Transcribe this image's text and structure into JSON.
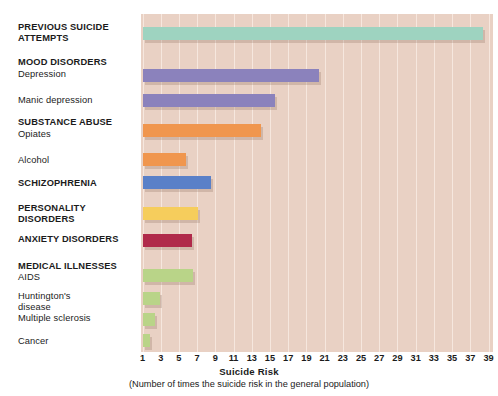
{
  "chart_data": {
    "type": "bar",
    "orientation": "horizontal",
    "title": "",
    "xlabel": "Suicide Risk",
    "caption": "(Number of times the suicide risk in the general population)",
    "ylabel": "",
    "xlim": [
      1,
      39
    ],
    "xticks": [
      1,
      3,
      5,
      7,
      9,
      11,
      13,
      15,
      17,
      19,
      21,
      23,
      25,
      27,
      29,
      31,
      33,
      35,
      37,
      39
    ],
    "grid": true,
    "legend": "none",
    "plot_background": "#e9d1c4",
    "gridline_color": "#f6e7de",
    "categories": [
      "PREVIOUS SUICIDE ATTEMPTS",
      "Depression",
      "Manic depression",
      "Opiates",
      "Alcohol",
      "SCHIZOPHRENIA",
      "PERSONALITY DISORDERS",
      "ANXIETY DISORDERS",
      "AIDS",
      "Huntington's disease",
      "Multiple sclerosis",
      "Cancer"
    ],
    "values": [
      38.4,
      20.4,
      15.5,
      14.0,
      5.8,
      8.5,
      7.1,
      6.4,
      6.6,
      2.9,
      2.4,
      1.8
    ],
    "bars": [
      {
        "label": "PREVIOUS SUICIDE ATTEMPTS",
        "value": 38.4,
        "color": "#9ed3c0"
      },
      {
        "label": "Depression",
        "value": 20.4,
        "color": "#8b82bc"
      },
      {
        "label": "Manic depression",
        "value": 15.5,
        "color": "#8b82bc"
      },
      {
        "label": "Opiates",
        "value": 14.0,
        "color": "#f0964e"
      },
      {
        "label": "Alcohol",
        "value": 5.8,
        "color": "#f0964e"
      },
      {
        "label": "SCHIZOPHRENIA",
        "value": 8.5,
        "color": "#5a80c8"
      },
      {
        "label": "PERSONALITY DISORDERS",
        "value": 7.1,
        "color": "#f6cd5c"
      },
      {
        "label": "ANXIETY DISORDERS",
        "value": 6.4,
        "color": "#b02a4a"
      },
      {
        "label": "AIDS",
        "value": 6.6,
        "color": "#b9d488"
      },
      {
        "label": "Huntington's disease",
        "value": 2.9,
        "color": "#b9d488"
      },
      {
        "label": "Multiple sclerosis",
        "value": 2.4,
        "color": "#b9d488"
      },
      {
        "label": "Cancer",
        "value": 1.8,
        "color": "#b9d488"
      }
    ]
  },
  "labels": [
    {
      "text": "PREVIOUS SUICIDE\nATTEMPTS",
      "style": "group",
      "top": 22
    },
    {
      "text": "MOOD DISORDERS",
      "style": "group",
      "top": 57
    },
    {
      "text": "Depression",
      "style": "sub",
      "top": 69
    },
    {
      "text": "Manic depression",
      "style": "sub",
      "top": 95
    },
    {
      "text": "SUBSTANCE ABUSE",
      "style": "group",
      "top": 117
    },
    {
      "text": "Opiates",
      "style": "sub",
      "top": 129
    },
    {
      "text": "Alcohol",
      "style": "sub",
      "top": 155
    },
    {
      "text": "SCHIZOPHRENIA",
      "style": "group",
      "top": 178
    },
    {
      "text": "PERSONALITY\nDISORDERS",
      "style": "group",
      "top": 203
    },
    {
      "text": "ANXIETY DISORDERS",
      "style": "group",
      "top": 234
    },
    {
      "text": "MEDICAL ILLNESSES",
      "style": "group",
      "top": 261
    },
    {
      "text": "AIDS",
      "style": "sub",
      "top": 272
    },
    {
      "text": "Huntington's\ndisease",
      "style": "sub",
      "top": 291
    },
    {
      "text": "Multiple sclerosis",
      "style": "sub",
      "top": 313
    },
    {
      "text": "Cancer",
      "style": "sub",
      "top": 336
    }
  ],
  "bar_rows": [
    {
      "name": "previous-suicide-attempts",
      "value": 38.4,
      "color": "#9ed3c0",
      "top": 27
    },
    {
      "name": "depression",
      "value": 20.4,
      "color": "#8b82bc",
      "top": 69
    },
    {
      "name": "manic-depression",
      "value": 15.5,
      "color": "#8b82bc",
      "top": 94
    },
    {
      "name": "opiates",
      "value": 14.0,
      "color": "#f0964e",
      "top": 124
    },
    {
      "name": "alcohol",
      "value": 5.8,
      "color": "#f0964e",
      "top": 153
    },
    {
      "name": "schizophrenia",
      "value": 8.5,
      "color": "#5a80c8",
      "top": 176
    },
    {
      "name": "personality-disorders",
      "value": 7.1,
      "color": "#f6cd5c",
      "top": 207
    },
    {
      "name": "anxiety-disorders",
      "value": 6.4,
      "color": "#b02a4a",
      "top": 234
    },
    {
      "name": "aids",
      "value": 6.6,
      "color": "#b9d488",
      "top": 269
    },
    {
      "name": "huntingtons-disease",
      "value": 2.9,
      "color": "#b9d488",
      "top": 292
    },
    {
      "name": "multiple-sclerosis",
      "value": 2.4,
      "color": "#b9d488",
      "top": 313
    },
    {
      "name": "cancer",
      "value": 1.8,
      "color": "#b9d488",
      "top": 334
    }
  ]
}
